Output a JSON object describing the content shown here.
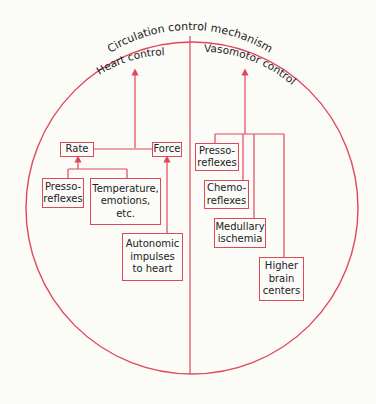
{
  "title": "Circulation control mechanism",
  "colors": {
    "line": "#e0485a",
    "text": "#222222",
    "background": "#fbfbf8"
  },
  "sections": {
    "left": {
      "label": "Heart control"
    },
    "right": {
      "label": "Vasomotor control"
    }
  },
  "heart_control": {
    "rate": "Rate",
    "force": "Force",
    "pressoreflexes": "Presso-\nreflexes",
    "temperature": "Temperature,\nemotions,\netc.",
    "autonomic": "Autonomic\nimpulses\nto heart"
  },
  "vasomotor_control": {
    "pressoreflexes": "Presso-\nreflexes",
    "chemoreflexes": "Chemo-\nreflexes",
    "medullary": "Medullary\nischemia",
    "higher_brain": "Higher\nbrain\ncenters"
  }
}
